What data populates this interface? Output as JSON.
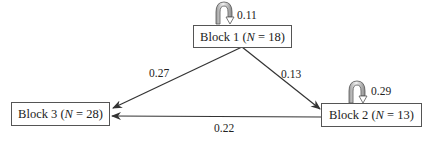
{
  "diagram": {
    "type": "transition-diagram",
    "blocks": [
      {
        "id": "block1",
        "name": "Block 1",
        "n_label": "N",
        "n_value": "18",
        "self_loop": "0.11"
      },
      {
        "id": "block2",
        "name": "Block 2",
        "n_label": "N",
        "n_value": "13",
        "self_loop": "0.29"
      },
      {
        "id": "block3",
        "name": "Block 3",
        "n_label": "N",
        "n_value": "28"
      }
    ],
    "edges": [
      {
        "from": "Block 1",
        "to": "Block 3",
        "label": "0.27"
      },
      {
        "from": "Block 1",
        "to": "Block 2",
        "label": "0.13"
      },
      {
        "from": "Block 2",
        "to": "Block 3",
        "label": "0.22"
      }
    ]
  },
  "labels": {
    "b1_open": "Block 1 (",
    "b1_n": "N",
    "b1_close": " = 18)",
    "b2_open": "Block 2 (",
    "b2_n": "N",
    "b2_close": " = 13)",
    "b3_open": "Block 3 (",
    "b3_n": "N",
    "b3_close": " = 28)",
    "loop1": "0.11",
    "loop2": "0.29",
    "e13": "0.27",
    "e12": "0.13",
    "e23": "0.22"
  }
}
